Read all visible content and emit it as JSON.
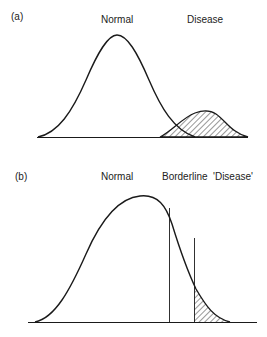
{
  "panels": [
    {
      "id": "a",
      "letter": "(a)",
      "labels": {
        "normal": "Normal",
        "disease": "Disease"
      }
    },
    {
      "id": "b",
      "letter": "(b)",
      "labels": {
        "normal": "Normal",
        "borderline": "Borderline",
        "disease": "'Disease'"
      }
    }
  ],
  "colors": {
    "line": "#1a1a1a",
    "text": "#222222",
    "background": "#ffffff"
  }
}
